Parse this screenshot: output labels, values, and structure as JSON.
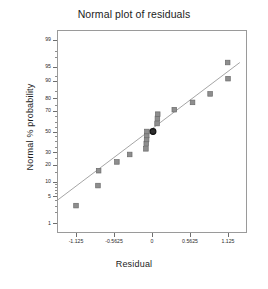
{
  "chart_data": {
    "type": "scatter",
    "title": "Normal plot of residuals",
    "xlabel": "Residual",
    "ylabel": "Normal % probability",
    "grid": false,
    "legend": "none",
    "xlim": [
      -1.40625,
      1.40625
    ],
    "ylim": [
      0.5,
      99.5
    ],
    "xticks": [
      -1.125,
      -0.5625,
      0,
      0.5625,
      1.125
    ],
    "xtick_labels": [
      "-1.125",
      "-0.5625",
      "0",
      "0.5625",
      "1.125"
    ],
    "yticks": [
      1,
      5,
      10,
      20,
      30,
      50,
      70,
      80,
      90,
      95,
      99
    ],
    "ytick_labels": [
      "1",
      "5",
      "10",
      "20",
      "30",
      "50",
      "70",
      "80",
      "90",
      "95",
      "99"
    ],
    "y_scale": "normal-probability",
    "series": [
      {
        "name": "Residuals",
        "marker": "square",
        "color": "#8e8e8e",
        "points": [
          {
            "x": -1.125,
            "y": 3
          },
          {
            "x": -0.8,
            "y": 8.5
          },
          {
            "x": -0.79,
            "y": 16
          },
          {
            "x": -0.52,
            "y": 22
          },
          {
            "x": -0.33,
            "y": 28
          },
          {
            "x": -0.09,
            "y": 33
          },
          {
            "x": -0.085,
            "y": 38
          },
          {
            "x": -0.08,
            "y": 42
          },
          {
            "x": -0.078,
            "y": 46
          },
          {
            "x": -0.075,
            "y": 50
          },
          {
            "x": 0.075,
            "y": 58
          },
          {
            "x": 0.08,
            "y": 63
          },
          {
            "x": 0.085,
            "y": 67
          },
          {
            "x": 0.33,
            "y": 71
          },
          {
            "x": 0.6,
            "y": 77
          },
          {
            "x": 0.86,
            "y": 83
          },
          {
            "x": 1.125,
            "y": 91
          },
          {
            "x": 1.12,
            "y": 96
          }
        ]
      },
      {
        "name": "Highlighted residual",
        "marker": "circle",
        "color": "#2f2f2f",
        "points": [
          {
            "x": 0.015,
            "y": 50
          }
        ]
      }
    ],
    "reference_line": {
      "name": "Normal reference line",
      "color": "#9b9b9b",
      "x1": -1.40625,
      "y1": 4,
      "x2": 1.3,
      "y2": 96
    }
  },
  "axes": {
    "title_text": "Normal plot of residuals",
    "x_axis_title": "Residual",
    "y_axis_title": "Normal % probability"
  },
  "colors": {
    "marker": "#8e8e8e",
    "marker_edge": "#6b6b6b",
    "highlight": "#2f2f2f",
    "line": "#9b9b9b",
    "frame": "#9a9a9a",
    "text": "#1c1c1c",
    "background": "#ffffff"
  }
}
